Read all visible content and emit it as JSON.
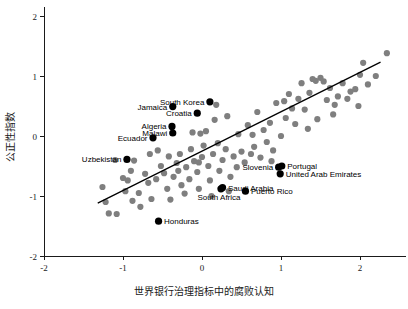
{
  "chart_data": {
    "type": "scatter",
    "title": "",
    "xlabel": "世界银行治理指标中的腐败认知",
    "ylabel": "公正性指数",
    "xlim": [
      -2.4,
      2.6
    ],
    "ylim": [
      -2.15,
      2.15
    ],
    "xticks": [
      -2,
      -1,
      0,
      1,
      2
    ],
    "xticklabels": [
      "-2",
      "-1",
      "0",
      "1",
      "2"
    ],
    "yticks": [
      -2,
      -1,
      0,
      1,
      2
    ],
    "yticklabels": [
      "-2",
      "-1",
      "0",
      "1",
      "2"
    ],
    "grid": false,
    "legend": "none",
    "colors": {
      "point": "#7f7f7f",
      "highlight": "#000000",
      "line": "#000000",
      "axis": "#1a1a1a"
    },
    "trendline": {
      "type": "linear",
      "x_start": -1.32,
      "y_start": -1.12,
      "x_end": 2.26,
      "y_end": 1.23
    },
    "labeled_points": [
      {
        "name": "South Korea",
        "x": 0.1,
        "y": 0.57,
        "label_side": "left"
      },
      {
        "name": "Jamaica",
        "x": -0.37,
        "y": 0.49,
        "label_side": "left"
      },
      {
        "name": "Croatia",
        "x": -0.06,
        "y": 0.38,
        "label_side": "left"
      },
      {
        "name": "Algeria",
        "x": -0.38,
        "y": 0.16,
        "label_side": "left"
      },
      {
        "name": "Malawi",
        "x": -0.37,
        "y": 0.05,
        "label_side": "left"
      },
      {
        "name": "Ecuador",
        "x": -0.62,
        "y": -0.03,
        "label_side": "left"
      },
      {
        "name": "Uzbekistan",
        "x": -0.95,
        "y": -0.39,
        "label_side": "left"
      },
      {
        "name": "Slovenia",
        "x": 0.97,
        "y": -0.52,
        "label_side": "left"
      },
      {
        "name": "Portugal",
        "x": 1.01,
        "y": -0.5,
        "label_side": "right"
      },
      {
        "name": "United Arab Emirates",
        "x": 0.99,
        "y": -0.63,
        "label_side": "right"
      },
      {
        "name": "Saudi Arabia",
        "x": 0.26,
        "y": -0.86,
        "label_side": "right"
      },
      {
        "name": "South Africa",
        "x": 0.24,
        "y": -0.88,
        "label_side": "below"
      },
      {
        "name": "Puerto Rico",
        "x": 0.55,
        "y": -0.92,
        "label_side": "right"
      },
      {
        "name": "Honduras",
        "x": -0.55,
        "y": -1.42,
        "label_side": "right"
      }
    ],
    "points": [
      {
        "x": -1.26,
        "y": -0.85
      },
      {
        "x": -1.22,
        "y": -1.1
      },
      {
        "x": -1.18,
        "y": -1.29
      },
      {
        "x": -1.08,
        "y": -1.3
      },
      {
        "x": -1.1,
        "y": -0.4
      },
      {
        "x": -1.0,
        "y": -0.7
      },
      {
        "x": -0.97,
        "y": -0.92
      },
      {
        "x": -0.9,
        "y": -0.58
      },
      {
        "x": -0.86,
        "y": -0.41
      },
      {
        "x": -0.8,
        "y": -0.95
      },
      {
        "x": -0.78,
        "y": -1.18
      },
      {
        "x": -0.72,
        "y": -0.63
      },
      {
        "x": -0.68,
        "y": -0.78
      },
      {
        "x": -0.64,
        "y": -1.05
      },
      {
        "x": -0.58,
        "y": -0.72
      },
      {
        "x": -0.52,
        "y": -0.5
      },
      {
        "x": -0.48,
        "y": -0.62
      },
      {
        "x": -0.44,
        "y": -0.88
      },
      {
        "x": -0.4,
        "y": -1.06
      },
      {
        "x": -0.36,
        "y": -0.68
      },
      {
        "x": -0.32,
        "y": -0.45
      },
      {
        "x": -0.3,
        "y": -0.58
      },
      {
        "x": -0.28,
        "y": -0.3
      },
      {
        "x": -0.26,
        "y": -0.82
      },
      {
        "x": -0.22,
        "y": -0.96
      },
      {
        "x": -0.2,
        "y": -0.52
      },
      {
        "x": -0.16,
        "y": -0.72
      },
      {
        "x": -0.14,
        "y": -0.22
      },
      {
        "x": -0.12,
        "y": 0.06
      },
      {
        "x": -0.1,
        "y": -0.42
      },
      {
        "x": -0.06,
        "y": -0.6
      },
      {
        "x": -0.04,
        "y": -0.88
      },
      {
        "x": 0.0,
        "y": -0.35
      },
      {
        "x": 0.02,
        "y": -0.16
      },
      {
        "x": 0.05,
        "y": 0.08
      },
      {
        "x": 0.08,
        "y": -0.5
      },
      {
        "x": 0.1,
        "y": -0.74
      },
      {
        "x": 0.12,
        "y": -1.0
      },
      {
        "x": 0.14,
        "y": -0.3
      },
      {
        "x": 0.16,
        "y": 0.27
      },
      {
        "x": 0.2,
        "y": -0.12
      },
      {
        "x": 0.22,
        "y": -0.58
      },
      {
        "x": 0.26,
        "y": -0.4
      },
      {
        "x": 0.3,
        "y": -0.22
      },
      {
        "x": 0.32,
        "y": 0.33
      },
      {
        "x": 0.36,
        "y": -0.68
      },
      {
        "x": 0.4,
        "y": -0.34
      },
      {
        "x": 0.44,
        "y": -0.52
      },
      {
        "x": 0.46,
        "y": 0.03
      },
      {
        "x": 0.5,
        "y": -0.26
      },
      {
        "x": 0.54,
        "y": -0.44
      },
      {
        "x": 0.58,
        "y": 0.18
      },
      {
        "x": 0.62,
        "y": -0.3
      },
      {
        "x": 0.66,
        "y": -0.18
      },
      {
        "x": 0.7,
        "y": 0.4
      },
      {
        "x": 0.74,
        "y": -0.36
      },
      {
        "x": 0.78,
        "y": 0.1
      },
      {
        "x": 0.82,
        "y": -0.1
      },
      {
        "x": 0.86,
        "y": 0.22
      },
      {
        "x": 0.9,
        "y": -0.24
      },
      {
        "x": 0.94,
        "y": 0.55
      },
      {
        "x": 1.0,
        "y": 0.0
      },
      {
        "x": 1.06,
        "y": 0.3
      },
      {
        "x": 1.1,
        "y": 0.7
      },
      {
        "x": 1.14,
        "y": 0.46
      },
      {
        "x": 1.18,
        "y": 0.2
      },
      {
        "x": 1.22,
        "y": 0.62
      },
      {
        "x": 1.26,
        "y": 0.88
      },
      {
        "x": 1.3,
        "y": 0.44
      },
      {
        "x": 1.34,
        "y": 0.12
      },
      {
        "x": 1.4,
        "y": 0.95
      },
      {
        "x": 1.44,
        "y": 0.92
      },
      {
        "x": 1.5,
        "y": 0.97
      },
      {
        "x": 1.54,
        "y": 0.91
      },
      {
        "x": 1.58,
        "y": 0.6
      },
      {
        "x": 1.62,
        "y": 0.8
      },
      {
        "x": 1.66,
        "y": 0.36
      },
      {
        "x": 1.72,
        "y": 0.66
      },
      {
        "x": 1.78,
        "y": 0.88
      },
      {
        "x": 1.84,
        "y": 0.62
      },
      {
        "x": 1.88,
        "y": 0.74
      },
      {
        "x": 1.94,
        "y": 0.78
      },
      {
        "x": 1.98,
        "y": 0.5
      },
      {
        "x": 2.04,
        "y": 1.22
      },
      {
        "x": 2.1,
        "y": 0.86
      },
      {
        "x": 2.2,
        "y": 1.0
      },
      {
        "x": 2.34,
        "y": 1.38
      },
      {
        "x": 0.18,
        "y": 0.52
      },
      {
        "x": -0.02,
        "y": 0.04
      },
      {
        "x": -0.42,
        "y": -0.34
      },
      {
        "x": -0.56,
        "y": -0.24
      },
      {
        "x": -0.88,
        "y": -1.08
      },
      {
        "x": -0.04,
        "y": -0.44
      },
      {
        "x": 0.64,
        "y": 0.02
      },
      {
        "x": 0.88,
        "y": -0.42
      },
      {
        "x": 1.04,
        "y": 0.58
      },
      {
        "x": 1.36,
        "y": 0.72
      },
      {
        "x": 1.46,
        "y": 0.28
      },
      {
        "x": 1.68,
        "y": 0.52
      },
      {
        "x": 2.0,
        "y": 1.02
      },
      {
        "x": 0.34,
        "y": -0.92
      },
      {
        "x": -0.66,
        "y": -0.3
      },
      {
        "x": -0.94,
        "y": -0.74
      }
    ]
  }
}
